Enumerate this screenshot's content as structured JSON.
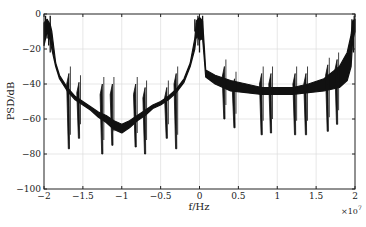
{
  "chart_data": {
    "type": "line",
    "title": "",
    "xlabel": "f/Hz",
    "ylabel": "PSD/dB",
    "x_multiplier": "×10^7",
    "xlim": [
      -2,
      2
    ],
    "ylim": [
      -100,
      0
    ],
    "xticks": [
      -2,
      -1.5,
      -1,
      -0.5,
      0,
      0.5,
      1,
      1.5,
      2
    ],
    "xtick_labels": [
      "−2",
      "−1.5",
      "−1",
      "−0.5",
      "0",
      "0.5",
      "1",
      "1.5",
      "2"
    ],
    "yticks": [
      0,
      -20,
      -40,
      -60,
      -80,
      -100
    ],
    "ytick_labels": [
      "0",
      "−20",
      "−40",
      "−60",
      "−80",
      "−100"
    ],
    "grid": true,
    "legend": null,
    "series": [
      {
        "name": "PSD",
        "color": "#111111",
        "description": "Power spectral density of a dense multi-carrier signal; envelope bands shown as filled dense oscillation",
        "envelope_upper": {
          "x": [
            -2.0,
            -1.96,
            -1.92,
            -1.9,
            -1.85,
            -1.8,
            -1.7,
            -1.6,
            -1.5,
            -1.4,
            -1.3,
            -1.2,
            -1.1,
            -1.0,
            -0.9,
            -0.8,
            -0.7,
            -0.6,
            -0.5,
            -0.4,
            -0.3,
            -0.2,
            -0.12,
            -0.06,
            -0.04,
            0.0,
            0.04,
            0.06,
            0.08,
            0.2,
            0.4,
            0.6,
            0.8,
            1.0,
            1.2,
            1.4,
            1.6,
            1.8,
            1.9,
            1.95,
            1.97,
            2.0
          ],
          "y": [
            -5,
            -3,
            -6,
            -10,
            -28,
            -35,
            -42,
            -47,
            -50,
            -53,
            -56,
            -58,
            -61,
            -63,
            -61,
            -58,
            -55,
            -52,
            -50,
            -47,
            -43,
            -37,
            -28,
            -14,
            -4,
            -2,
            -4,
            -18,
            -32,
            -35,
            -38,
            -40,
            -42,
            -42,
            -42,
            -40,
            -37,
            -30,
            -22,
            -12,
            -4,
            -3
          ]
        },
        "envelope_lower": {
          "x": [
            -2.0,
            -1.96,
            -1.92,
            -1.9,
            -1.85,
            -1.8,
            -1.7,
            -1.6,
            -1.5,
            -1.4,
            -1.3,
            -1.2,
            -1.1,
            -1.0,
            -0.9,
            -0.8,
            -0.7,
            -0.6,
            -0.5,
            -0.4,
            -0.3,
            -0.2,
            -0.12,
            -0.06,
            -0.04,
            0.0,
            0.04,
            0.06,
            0.08,
            0.2,
            0.4,
            0.6,
            0.8,
            1.0,
            1.2,
            1.4,
            1.6,
            1.8,
            1.9,
            1.95,
            1.97,
            2.0
          ],
          "y": [
            -18,
            -10,
            -15,
            -20,
            -30,
            -37,
            -44,
            -49,
            -52,
            -55,
            -59,
            -62,
            -66,
            -68,
            -65,
            -61,
            -58,
            -54,
            -52,
            -49,
            -45,
            -39,
            -30,
            -20,
            -12,
            -15,
            -14,
            -25,
            -36,
            -40,
            -44,
            -45,
            -46,
            -46,
            -46,
            -45,
            -44,
            -42,
            -38,
            -30,
            -15,
            -10
          ]
        },
        "spikes": [
          {
            "x": -1.68,
            "top": -34,
            "bottom": -77
          },
          {
            "x": -1.55,
            "top": -39,
            "bottom": -71
          },
          {
            "x": -1.25,
            "top": -40,
            "bottom": -80
          },
          {
            "x": -1.12,
            "top": -40,
            "bottom": -75
          },
          {
            "x": -0.82,
            "top": -40,
            "bottom": -76
          },
          {
            "x": -0.7,
            "top": -42,
            "bottom": -80
          },
          {
            "x": -0.42,
            "top": -42,
            "bottom": -71
          },
          {
            "x": -0.3,
            "top": -34,
            "bottom": -77
          },
          {
            "x": 0.32,
            "top": -30,
            "bottom": -60
          },
          {
            "x": 0.45,
            "top": -37,
            "bottom": -65
          },
          {
            "x": 0.8,
            "top": -34,
            "bottom": -69
          },
          {
            "x": 0.92,
            "top": -34,
            "bottom": -68
          },
          {
            "x": 1.23,
            "top": -34,
            "bottom": -69
          },
          {
            "x": 1.37,
            "top": -34,
            "bottom": -69
          },
          {
            "x": 1.65,
            "top": -29,
            "bottom": -67
          },
          {
            "x": 1.77,
            "top": -26,
            "bottom": -63
          }
        ]
      }
    ]
  },
  "labels": {
    "xlabel": "f/Hz",
    "ylabel": "PSD/dB",
    "multiplier_base": "×10",
    "multiplier_exp": "7"
  }
}
